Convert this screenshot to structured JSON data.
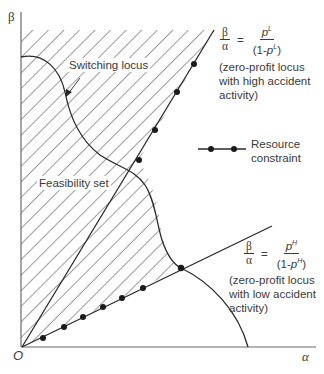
{
  "diagram": {
    "axes": {
      "y_label": "β",
      "x_label": "α",
      "origin_label": "O"
    },
    "labels": {
      "switching_locus": "Switching locus",
      "feasibility_set": "Feasibility set",
      "resource_constraint_line1": "Resource",
      "resource_constraint_line2": "constraint"
    },
    "high_locus": {
      "lhs_num": "β",
      "lhs_den": "α",
      "equals": "=",
      "rhs_num_base": "p",
      "rhs_num_sup": "L",
      "rhs_den_prefix": "(1-",
      "rhs_den_base": "p",
      "rhs_den_sup": "L",
      "rhs_den_suffix": ")",
      "note_line1": "(zero-profit locus",
      "note_line2": "with high accident",
      "note_line3": "activity)"
    },
    "low_locus": {
      "lhs_num": "β",
      "lhs_den": "α",
      "equals": "=",
      "rhs_num_base": "p",
      "rhs_num_sup": "H",
      "rhs_den_prefix": "(1-",
      "rhs_den_base": "p",
      "rhs_den_sup": "H",
      "rhs_den_suffix": ")",
      "note_line1": "(zero-profit locus",
      "note_line2": "with low accident",
      "note_line3": "activity)"
    },
    "colors": {
      "line": "#2a2a2a",
      "hatch": "#4a4a4a",
      "text": "#3a3a3a",
      "background": "#ffffff"
    }
  }
}
